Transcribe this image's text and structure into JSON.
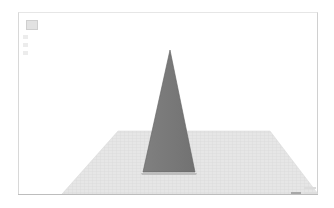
{
  "viewport": {
    "background": "#ffffff",
    "border_color": "#d0d0d0"
  },
  "toolbar": {
    "items": [
      {
        "icon": "view-cube-icon"
      },
      {
        "icon": "tool-icon"
      },
      {
        "icon": "tool-icon"
      },
      {
        "icon": "tool-icon"
      }
    ]
  },
  "scene": {
    "object": {
      "type": "pyramid",
      "color": "#7a7a7a",
      "edge_color": "#5e5e5e",
      "apex": [
        170,
        50
      ],
      "base_left": [
        143,
        172
      ],
      "base_right": [
        195,
        172
      ]
    },
    "floor": {
      "color": "#e4e4e4",
      "grid_color": "#cfcfcf",
      "back_left": [
        118,
        131
      ],
      "back_right": [
        270,
        131
      ],
      "front_left": [
        62,
        194
      ],
      "front_right": [
        318,
        194
      ]
    }
  },
  "status": {
    "line1": "",
    "line2_left": "",
    "line2_right": ""
  }
}
